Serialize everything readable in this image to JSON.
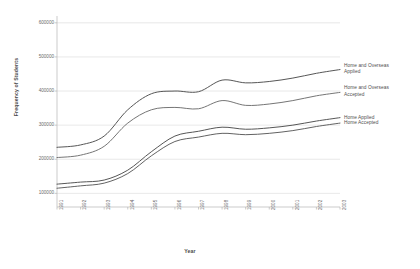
{
  "chart_data": {
    "type": "line",
    "title": "",
    "xlabel": "Year",
    "ylabel": "Frequency of Students",
    "x": [
      1991,
      1992,
      1993,
      1994,
      1995,
      1996,
      1997,
      1998,
      1999,
      2000,
      2001,
      2002,
      2003
    ],
    "xticklabels": [
      "1991",
      "1992",
      "1993",
      "1994",
      "1995",
      "1996",
      "1997",
      "1998",
      "1999",
      "2000",
      "2001",
      "2002",
      "2003"
    ],
    "yticklabels": [
      "100000",
      "200000",
      "300000",
      "400000",
      "500000",
      "600000"
    ],
    "yticks": [
      100000,
      200000,
      300000,
      400000,
      500000,
      600000
    ],
    "ylim": [
      60000,
      620000
    ],
    "xlim": [
      1991,
      2003
    ],
    "grid": true,
    "grid_axis": "y",
    "legend": "inline-right-labels",
    "series": [
      {
        "name": "Home and Overseas Applied",
        "label": "Home and Overseas\nApplied",
        "color": "#4d4d4d",
        "values": [
          235000,
          242000,
          268000,
          345000,
          392000,
          400000,
          398000,
          432000,
          424000,
          428000,
          438000,
          452000,
          463000
        ]
      },
      {
        "name": "Home and Overseas Accepted",
        "label": "Home and Overseas\nAccepted",
        "color": "#6e6e6e",
        "values": [
          205000,
          212000,
          238000,
          306000,
          345000,
          352000,
          348000,
          372000,
          358000,
          362000,
          372000,
          386000,
          396000
        ]
      },
      {
        "name": "Home Applied",
        "label": "Home Applied",
        "color": "#4d4d4d",
        "values": [
          127000,
          133000,
          139000,
          168000,
          222000,
          268000,
          282000,
          294000,
          288000,
          292000,
          300000,
          312000,
          322000
        ]
      },
      {
        "name": "Home Accepted",
        "label": "Home Accepted",
        "color": "#5a5a5a",
        "values": [
          115000,
          122000,
          130000,
          158000,
          210000,
          252000,
          265000,
          276000,
          272000,
          276000,
          284000,
          296000,
          306000
        ]
      }
    ]
  },
  "axis_titles": {
    "y": "Frequency of Students",
    "x": "Year"
  },
  "colors": {
    "grid": "#d9d9d9",
    "axis": "#b4b4b4",
    "text": "#6a6a6a",
    "line": "#4d4d4d",
    "background": "#ffffff"
  }
}
